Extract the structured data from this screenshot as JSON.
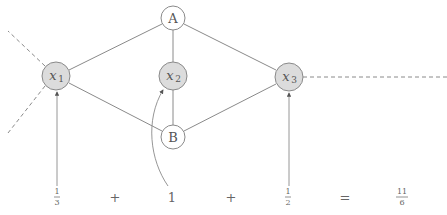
{
  "diagram": {
    "nodes": [
      {
        "id": "A",
        "label": "A",
        "type": "plain"
      },
      {
        "id": "B",
        "label": "B",
        "type": "plain"
      },
      {
        "id": "x1",
        "label_base": "x",
        "label_sub": "1",
        "type": "variable"
      },
      {
        "id": "x2",
        "label_base": "x",
        "label_sub": "2",
        "type": "variable"
      },
      {
        "id": "x3",
        "label_base": "x",
        "label_sub": "3",
        "type": "variable"
      }
    ],
    "edges": [
      [
        "A",
        "x1"
      ],
      [
        "A",
        "x2"
      ],
      [
        "A",
        "x3"
      ],
      [
        "B",
        "x1"
      ],
      [
        "B",
        "x2"
      ],
      [
        "B",
        "x3"
      ]
    ],
    "dangling_dashed_edges": [
      "x1-upper-left",
      "x1-lower-left",
      "x3-right"
    ],
    "equation": {
      "terms": [
        {
          "num": "1",
          "den": "3",
          "points_to": "x1"
        },
        {
          "op": "+"
        },
        {
          "value": "1",
          "points_to": "x2"
        },
        {
          "op": "+"
        },
        {
          "num": "1",
          "den": "2",
          "points_to": "x3"
        },
        {
          "op": "="
        },
        {
          "num": "11",
          "den": "6"
        }
      ]
    },
    "colors": {
      "variable_fill": "#dcdcdc",
      "plain_fill": "#ffffff",
      "stroke": "#8a8a8a",
      "text": "#555555"
    }
  }
}
